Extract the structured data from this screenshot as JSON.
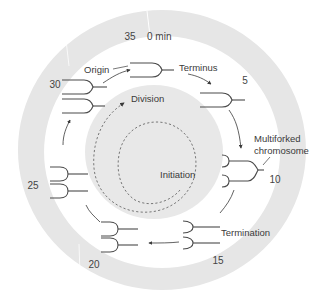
{
  "diagram": {
    "colors": {
      "outer_ring": "#e6e6e6",
      "inner_disc": "#e8e8e8",
      "line": "#4a4a4a",
      "text": "#3a3a3a",
      "background": "#ffffff"
    },
    "time_ticks": [
      {
        "label": "0 min"
      },
      {
        "label": "5"
      },
      {
        "label": "10"
      },
      {
        "label": "15"
      },
      {
        "label": "20"
      },
      {
        "label": "25"
      },
      {
        "label": "30"
      },
      {
        "label": "35"
      }
    ],
    "stage_labels": {
      "origin": "Origin",
      "terminus": "Terminus",
      "multiforked": "Multiforked",
      "chromosome": "chromosome",
      "termination": "Termination",
      "division": "Division",
      "initiation": "Initiation"
    }
  }
}
